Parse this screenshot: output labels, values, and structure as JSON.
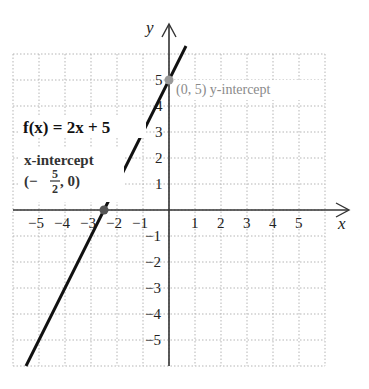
{
  "chart_data": {
    "type": "line",
    "title": "",
    "xlabel": "x",
    "ylabel": "y",
    "xlim": [
      -6,
      6
    ],
    "ylim": [
      -6,
      6
    ],
    "grid": true,
    "x_ticks": [
      -5,
      -4,
      -3,
      -2,
      -1,
      1,
      2,
      3,
      4,
      5
    ],
    "y_ticks": [
      -5,
      -4,
      -3,
      -2,
      -1,
      1,
      2,
      3,
      4,
      5
    ],
    "x_tick_labels": [
      "−5",
      "−4",
      "−3",
      "−2",
      "−1",
      "1",
      "2",
      "3",
      "4",
      "5"
    ],
    "y_tick_labels": [
      "−5",
      "−4",
      "−3",
      "−2",
      "−1",
      "1",
      "2",
      "3",
      "4",
      "5"
    ],
    "series": [
      {
        "name": "f(x) = 2x + 5",
        "slope": 2,
        "intercept": 5,
        "x": [
          -5.5,
          0.5
        ],
        "y": [
          -6,
          6
        ]
      }
    ],
    "points": [
      {
        "name": "x-intercept",
        "x": -2.5,
        "y": 0,
        "color": "#555555"
      },
      {
        "name": "y-intercept",
        "x": 0,
        "y": 5,
        "color": "#999999"
      }
    ],
    "annotations": {
      "function_label": "f(x) = 2x + 5",
      "x_intercept_title": "x-intercept",
      "x_intercept_open": "(−",
      "x_intercept_num": "5",
      "x_intercept_den": "2",
      "x_intercept_close": ", 0)",
      "y_intercept_label": "(0, 5) y-intercept"
    },
    "colors": {
      "line": "#111111",
      "axis": "#333333",
      "grid": "#b5b5b5",
      "y_intercept_text": "#8a8a8a"
    }
  }
}
